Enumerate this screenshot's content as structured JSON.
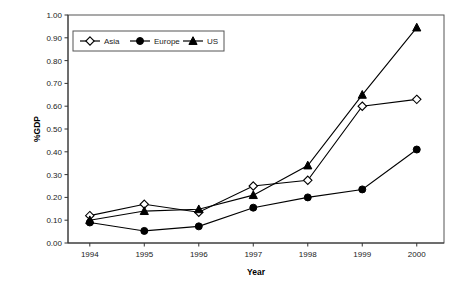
{
  "chart_data": {
    "type": "line",
    "title": "",
    "subtitle": "",
    "xlabel": "Year",
    "ylabel": "%GDP",
    "categories": [
      "1994",
      "1995",
      "1996",
      "1997",
      "1998",
      "1999",
      "2000"
    ],
    "x": [
      1994,
      1995,
      1996,
      1997,
      1998,
      1999,
      2000
    ],
    "xlim": [
      1993.6,
      2000.5
    ],
    "ylim": [
      0.0,
      1.0
    ],
    "y_ticks": [
      "0.00",
      "0.10",
      "0.20",
      "0.30",
      "0.40",
      "0.50",
      "0.60",
      "0.70",
      "0.80",
      "0.90",
      "1.00"
    ],
    "y_tick_values": [
      0.0,
      0.1,
      0.2,
      0.3,
      0.4,
      0.5,
      0.6,
      0.7,
      0.8,
      0.9,
      1.0
    ],
    "grid": false,
    "legend_position": "top-left-inside",
    "series": [
      {
        "name": "Asia",
        "marker": "open-diamond",
        "color": "#000000",
        "values": [
          0.12,
          0.17,
          0.135,
          0.25,
          0.275,
          0.6,
          0.63
        ]
      },
      {
        "name": "Europe",
        "marker": "filled-circle",
        "color": "#000000",
        "values": [
          0.09,
          0.053,
          0.073,
          0.155,
          0.2,
          0.235,
          0.41
        ]
      },
      {
        "name": "US",
        "marker": "filled-triangle",
        "color": "#000000",
        "values": [
          0.1,
          0.14,
          0.148,
          0.21,
          0.34,
          0.65,
          0.945
        ]
      }
    ]
  },
  "legend": {
    "items": [
      {
        "label": "Asia"
      },
      {
        "label": "Europe"
      },
      {
        "label": "US"
      }
    ]
  },
  "axes": {
    "y_title": "%GDP",
    "x_title": "Year"
  }
}
